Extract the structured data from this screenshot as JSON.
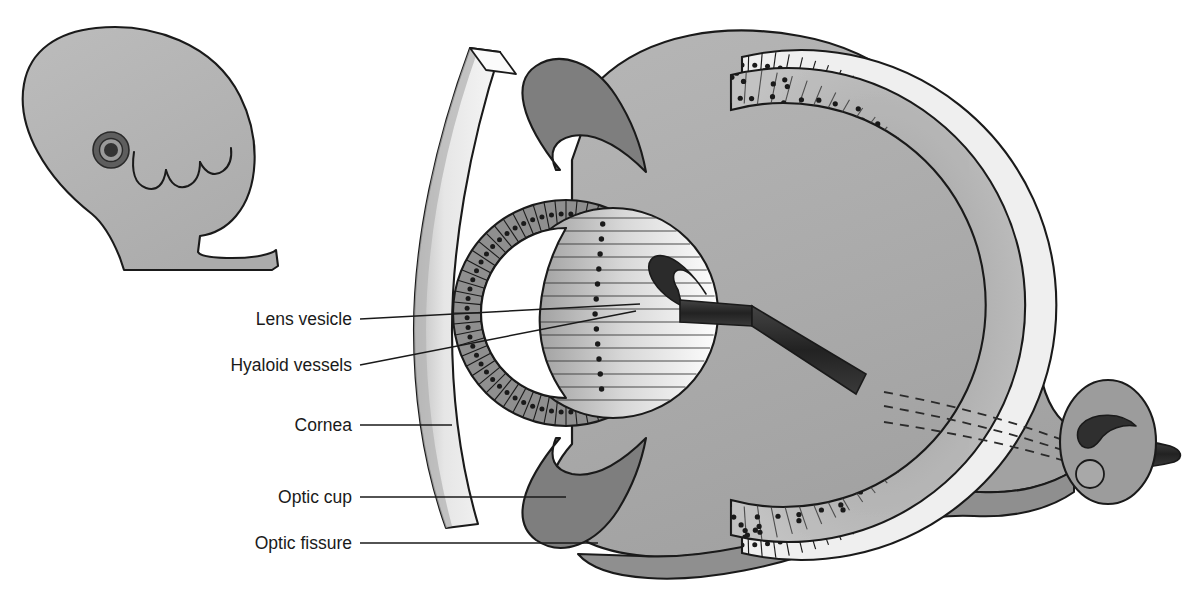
{
  "figure": {
    "type": "anatomical-diagram",
    "background_color": "#ffffff",
    "line_color": "#1a1a1a"
  },
  "palette": {
    "outline": "#1a1a1a",
    "mesenchyme": "#adadad",
    "mesenchyme_shadow": "#8f8f8f",
    "neural_retina_dark": "#8a8a8a",
    "neural_retina_light": "#bdbdbd",
    "pigment_epithelium": "#efefef",
    "cup_rim_dark": "#7e7e7e",
    "cornea_face": "#ededed",
    "cornea_edge": "#b4b4b4",
    "lens_dark": "#8d8d8d",
    "lens_light": "#fdfdfd",
    "vessel": "#2b2b2b",
    "embryo_body": "#b5b5b5",
    "embryo_eye_ring": "#5e5e5e",
    "embryo_eye_core": "#3a3a3a"
  },
  "labels": [
    {
      "id": "lens-vesicle",
      "text": "Lens vesicle",
      "x": 352,
      "y": 325,
      "leader": {
        "x1": 360,
        "y1": 319,
        "x2": 640,
        "y2": 304
      }
    },
    {
      "id": "hyaloid-vessels",
      "text": "Hyaloid vessels",
      "x": 352,
      "y": 371,
      "leader": {
        "x1": 360,
        "y1": 365,
        "x2": 636,
        "y2": 311
      }
    },
    {
      "id": "cornea",
      "text": "Cornea",
      "x": 352,
      "y": 431,
      "leader": {
        "x1": 360,
        "y1": 425,
        "x2": 452,
        "y2": 425
      }
    },
    {
      "id": "optic-cup",
      "text": "Optic cup",
      "x": 352,
      "y": 503,
      "leader": {
        "x1": 360,
        "y1": 497,
        "x2": 566,
        "y2": 497
      }
    },
    {
      "id": "optic-fissure",
      "text": "Optic fissure",
      "x": 352,
      "y": 549,
      "leader": {
        "x1": 360,
        "y1": 543,
        "x2": 598,
        "y2": 543
      }
    }
  ],
  "structures": {
    "embryo_inset": "embryo head in profile with eye spot and pharyngeal arches",
    "cornea": "surface ectoderm slab anterior to the optic cup",
    "optic_cup": "double-walled cup: outer pigment epithelium, inner neural retina",
    "lens_vesicle": "hollow lens vesicle with elongating posterior fibres",
    "hyaloid_vessels": "hyaloid artery running through the optic fissure to the lens",
    "optic_stalk": "optic stalk continuous with the cup, containing the optic fissure",
    "optic_fissure": "groove on the inferior surface of cup and stalk"
  }
}
